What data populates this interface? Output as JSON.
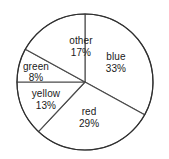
{
  "chart_data": {
    "type": "pie",
    "title": "",
    "subtitle": "",
    "xlabel": "",
    "ylabel": "",
    "legend_position": "none",
    "grid": false,
    "labels_inside_slices": true,
    "value_unit": "%",
    "total": 100,
    "categories": [
      "blue",
      "red",
      "yellow",
      "green",
      "other"
    ],
    "values": [
      33,
      29,
      13,
      8,
      17
    ],
    "slices": [
      {
        "name": "blue",
        "label": "blue",
        "value": 33,
        "value_label": "33%",
        "start_angle_deg": 0,
        "end_angle_deg": 118.8,
        "fill": "#ffffff",
        "stroke": "#4a4a4a",
        "label_x_pct": 68.6,
        "label_y_pct": 39.0
      },
      {
        "name": "red",
        "label": "red",
        "value": 29,
        "value_label": "29%",
        "start_angle_deg": 118.8,
        "end_angle_deg": 223.2,
        "fill": "#ffffff",
        "stroke": "#4a4a4a",
        "label_x_pct": 52.7,
        "label_y_pct": 73.6
      },
      {
        "name": "yellow",
        "label": "yellow",
        "value": 13,
        "value_label": "13%",
        "start_angle_deg": 223.2,
        "end_angle_deg": 270.0,
        "fill": "#ffffff",
        "stroke": "#4a4a4a",
        "label_x_pct": 27.2,
        "label_y_pct": 62.3
      },
      {
        "name": "green",
        "label": "green",
        "value": 8,
        "value_label": "8%",
        "start_angle_deg": 270.0,
        "end_angle_deg": 298.8,
        "fill": "#ffffff",
        "stroke": "#4a4a4a",
        "label_x_pct": 21.3,
        "label_y_pct": 45.0
      },
      {
        "name": "other",
        "label": "other",
        "value": 17,
        "value_label": "17%",
        "start_angle_deg": 298.8,
        "end_angle_deg": 360.0,
        "fill": "#ffffff",
        "stroke": "#4a4a4a",
        "label_x_pct": 47.9,
        "label_y_pct": 29.0
      }
    ],
    "geometry": {
      "center_x": 85,
      "center_y": 82,
      "radius": 68,
      "start_at_top": true,
      "direction": "clockwise"
    },
    "colors": {
      "background": "#ffffff",
      "slice_fill": "#ffffff",
      "slice_stroke": "#4a4a4a",
      "outline_stroke": "#2e2e2e",
      "label_text": "#1a1a1a"
    }
  }
}
